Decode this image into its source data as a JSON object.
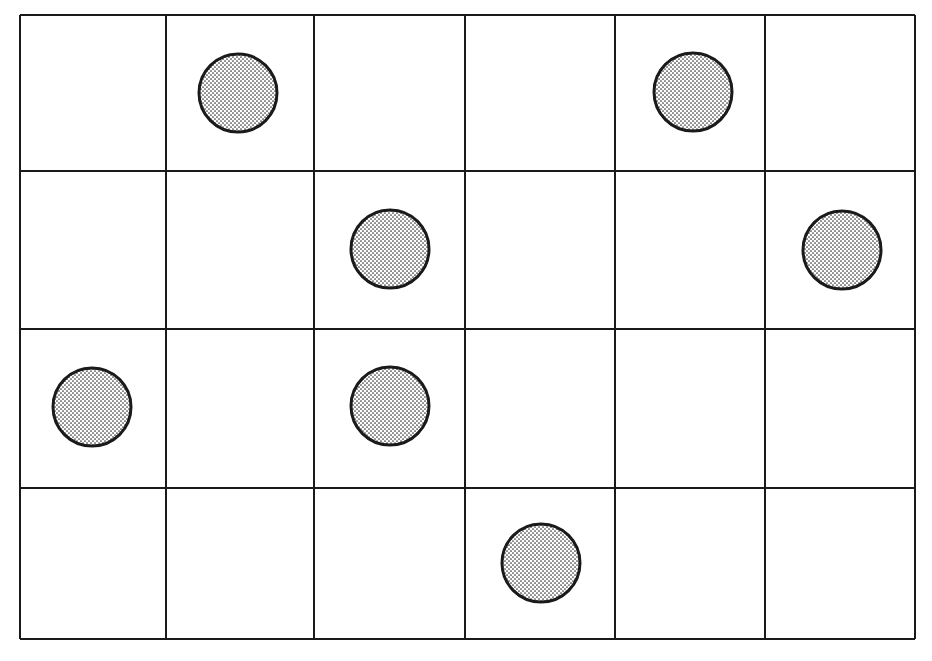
{
  "diagram": {
    "type": "grid-with-markers",
    "rows": 4,
    "columns": 6,
    "grid": {
      "left": 20,
      "top": 15,
      "right": 915,
      "bottom": 639,
      "column_lines": [
        20,
        166,
        314,
        465,
        615,
        765,
        915
      ],
      "row_lines": [
        15,
        171,
        329,
        488,
        639
      ],
      "line_color": "#1a1a1a"
    },
    "marker": {
      "shape": "circle",
      "fill": "stippled-dots",
      "radius": 39,
      "outline_color": "#1a1a1a",
      "dot_color": "#333333",
      "background": "#ffffff"
    },
    "markers": [
      {
        "row": 0,
        "col": 1,
        "cx": 238,
        "cy": 93
      },
      {
        "row": 0,
        "col": 4,
        "cx": 693,
        "cy": 92
      },
      {
        "row": 1,
        "col": 2,
        "cx": 390,
        "cy": 249
      },
      {
        "row": 1,
        "col": 5,
        "cx": 842,
        "cy": 250
      },
      {
        "row": 2,
        "col": 0,
        "cx": 92,
        "cy": 407
      },
      {
        "row": 2,
        "col": 2,
        "cx": 390,
        "cy": 406
      },
      {
        "row": 3,
        "col": 3,
        "cx": 541,
        "cy": 563
      }
    ]
  }
}
